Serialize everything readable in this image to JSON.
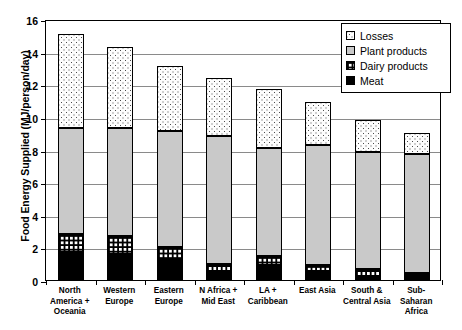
{
  "chart_data": {
    "type": "bar",
    "subtype": "stacked-bar",
    "title": "",
    "xlabel": "",
    "ylabel": "Food Energy Supplied (MJ/person/day)",
    "ylim": [
      0,
      16
    ],
    "yticks": [
      0,
      2,
      4,
      6,
      8,
      10,
      12,
      14,
      16
    ],
    "grid": true,
    "legend_position": "top-right",
    "categories": [
      "North America + Oceania",
      "Western Europe",
      "Eastern Europe",
      "N Africa + Mid East",
      "LA + Caribbean",
      "East Asia",
      "South & Central Asia",
      "Sub-Saharan Africa"
    ],
    "series": [
      {
        "name": "Meat",
        "values": [
          1.7,
          1.6,
          1.2,
          0.55,
          0.95,
          0.55,
          0.25,
          0.3
        ]
      },
      {
        "name": "Dairy products",
        "values": [
          1.15,
          1.1,
          0.8,
          0.45,
          0.5,
          0.35,
          0.4,
          0.15
        ]
      },
      {
        "name": "Plant products",
        "values": [
          6.45,
          6.6,
          7.15,
          7.85,
          6.65,
          7.35,
          7.2,
          7.25
        ]
      },
      {
        "name": "Losses",
        "values": [
          5.8,
          5.0,
          3.95,
          3.55,
          3.6,
          2.65,
          1.95,
          1.3
        ]
      }
    ],
    "totals": [
      15.1,
      14.3,
      13.15,
      12.4,
      11.7,
      10.9,
      9.8,
      9.0
    ],
    "colors": {
      "meat": "#000000",
      "dairy": "#ffffff",
      "plant": "#c9c9c9",
      "losses": "#fdfdfd",
      "axis": "#000000",
      "gridline": "#8a8a8a"
    }
  },
  "legend": {
    "items": [
      {
        "label": "Losses",
        "swatch": "dotted-pattern-swatch"
      },
      {
        "label": "Plant products",
        "swatch": "gray-fill-swatch"
      },
      {
        "label": "Dairy products",
        "swatch": "checkered-pattern-swatch"
      },
      {
        "label": "Meat",
        "swatch": "black-fill-swatch"
      }
    ]
  },
  "x_axis": {
    "labels": [
      [
        "North",
        "America +",
        "Oceania"
      ],
      [
        "Western",
        "Europe"
      ],
      [
        "Eastern",
        "Europe"
      ],
      [
        "N Africa +",
        "Mid East"
      ],
      [
        "LA +",
        "Caribbean"
      ],
      [
        "East Asia"
      ],
      [
        "South &",
        "Central Asia"
      ],
      [
        "Sub-",
        "Saharan",
        "Africa"
      ]
    ]
  },
  "y_axis": {
    "title": "Food Energy Supplied (MJ/person/day)",
    "ticks": [
      "0",
      "2",
      "4",
      "6",
      "8",
      "10",
      "12",
      "14",
      "16"
    ]
  }
}
